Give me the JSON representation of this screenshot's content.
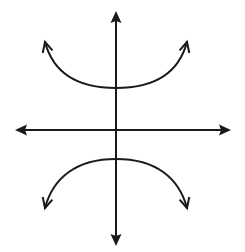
{
  "diagram": {
    "type": "hyperbola-sketch",
    "stroke_color": "#1a1a1a",
    "background_color": "#ffffff",
    "axes": {
      "x_axis": {
        "y": 130,
        "x_start": 15,
        "x_end": 231,
        "arrows": [
          "left",
          "right"
        ]
      },
      "y_axis": {
        "x": 116,
        "y_start": 11,
        "y_end": 246,
        "arrows": [
          "up",
          "down"
        ]
      }
    },
    "curves": [
      {
        "name": "upper-branch",
        "opens": "up",
        "vertex": [
          116,
          88
        ],
        "left_end": [
          45,
          42
        ],
        "right_end": [
          187,
          42
        ]
      },
      {
        "name": "lower-branch",
        "opens": "down",
        "vertex": [
          116,
          159
        ],
        "left_end": [
          45,
          208
        ],
        "right_end": [
          187,
          208
        ]
      }
    ]
  }
}
